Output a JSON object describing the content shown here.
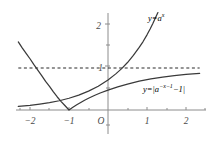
{
  "figure": {
    "background_color": "#ffffff",
    "axis_color": "#8c8c8c",
    "curve_color": "#3a3a3a",
    "dashed_color": "#2b2b2b",
    "label_color": "#4f4f4f"
  },
  "chart_data": {
    "type": "line",
    "title": "",
    "xlabel": "",
    "ylabel": "",
    "xlim": [
      -2.3,
      2.5
    ],
    "ylim": [
      -0.55,
      2.3
    ],
    "grid": false,
    "legend": "inline-labels",
    "origin_label": "O",
    "x_ticks": [
      -2,
      -1,
      1,
      2
    ],
    "x_tick_labels": [
      "-2",
      "-1",
      "1",
      "2"
    ],
    "x_minor_ticks": [
      -2.5,
      -1.5,
      -0.5,
      0.5,
      1.5,
      2.5
    ],
    "y_ticks": [
      1,
      2
    ],
    "y_tick_labels": [
      "1",
      "2"
    ],
    "y_minor_ticks": [
      0.5,
      1.5
    ],
    "annotations": [
      {
        "name": "asymptote",
        "kind": "horizontal-dashed-line",
        "y": 1,
        "x_start": -2.3,
        "x_end": 2.35
      }
    ],
    "series": [
      {
        "name": "y=a^x",
        "label_html": "y=a<sup>x</sup>",
        "label_x": 1.02,
        "label_y": 2.18,
        "style": "solid",
        "points": [
          [
            -2.3,
            0.085
          ],
          [
            -2.0,
            0.11
          ],
          [
            -1.75,
            0.14
          ],
          [
            -1.5,
            0.175
          ],
          [
            -1.25,
            0.22
          ],
          [
            -1.0,
            0.28
          ],
          [
            -0.75,
            0.355
          ],
          [
            -0.5,
            0.45
          ],
          [
            -0.25,
            0.565
          ],
          [
            0.0,
            0.715
          ],
          [
            0.2,
            0.86
          ],
          [
            0.35,
            0.985
          ],
          [
            0.5,
            1.13
          ],
          [
            0.65,
            1.3
          ],
          [
            0.8,
            1.49
          ],
          [
            0.9,
            1.63
          ],
          [
            1.0,
            1.79
          ],
          [
            1.08,
            1.93
          ],
          [
            1.15,
            2.06
          ],
          [
            1.22,
            2.2
          ],
          [
            1.28,
            2.32
          ]
        ]
      },
      {
        "name": "y=|a^(-x-1)-1|",
        "label_html": "y=|a<sup>-x-1</sup>-1|",
        "label_x": 1.08,
        "label_y": 0.52,
        "style": "solid",
        "points": [
          [
            -2.3,
            1.62
          ],
          [
            -2.2,
            1.48
          ],
          [
            -2.1,
            1.35
          ],
          [
            -2.0,
            1.22
          ],
          [
            -1.9,
            1.08
          ],
          [
            -1.8,
            0.95
          ],
          [
            -1.7,
            0.82
          ],
          [
            -1.6,
            0.68
          ],
          [
            -1.5,
            0.56
          ],
          [
            -1.4,
            0.43
          ],
          [
            -1.3,
            0.31
          ],
          [
            -1.2,
            0.2
          ],
          [
            -1.1,
            0.1
          ],
          [
            -1.0,
            0.0
          ],
          [
            -0.9,
            0.065
          ],
          [
            -0.8,
            0.125
          ],
          [
            -0.7,
            0.18
          ],
          [
            -0.6,
            0.233
          ],
          [
            -0.5,
            0.28
          ],
          [
            -0.35,
            0.345
          ],
          [
            -0.2,
            0.405
          ],
          [
            0.0,
            0.475
          ],
          [
            0.25,
            0.55
          ],
          [
            0.5,
            0.615
          ],
          [
            0.8,
            0.685
          ],
          [
            1.1,
            0.74
          ],
          [
            1.4,
            0.785
          ],
          [
            1.7,
            0.82
          ],
          [
            2.0,
            0.848
          ],
          [
            2.35,
            0.872
          ]
        ]
      }
    ]
  }
}
